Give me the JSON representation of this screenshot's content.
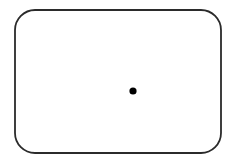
{
  "canvas": {
    "width": 237,
    "height": 161,
    "background_color": "#ffffff",
    "description": "Line drawing of an empty rounded rectangle containing a single small filled dot"
  },
  "figure": {
    "name": "rounded-rectangle-with-dot",
    "shapes": [
      {
        "kind": "rounded-rectangle",
        "name": "boundary-rectangle",
        "x": 15,
        "y": 10,
        "width": 206,
        "height": 143,
        "corner_radius": 20,
        "stroke_color": "#2b2b2b",
        "stroke_width": 1.8,
        "fill_color": "none"
      },
      {
        "kind": "circle",
        "name": "center-dot",
        "cx": 133,
        "cy": 91,
        "r": 3.6,
        "fill_color": "#000000",
        "stroke_color": "none",
        "stroke_width": 0
      }
    ]
  }
}
